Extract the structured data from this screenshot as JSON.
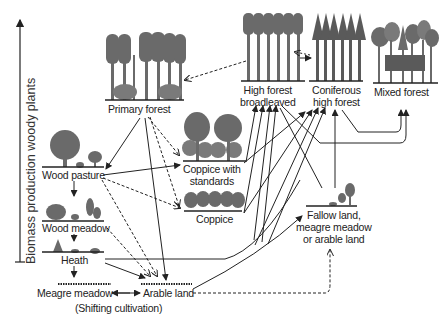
{
  "axis": {
    "label": "Biomass production woody plants"
  },
  "nodes": {
    "primary_forest": "Primary forest",
    "high_forest_broadleaved_1": "High forest",
    "high_forest_broadleaved_2": "broadleaved",
    "coniferous_1": "Coniferous",
    "coniferous_2": "high forest",
    "mixed_forest": "Mixed forest",
    "coppice_standards_1": "Coppice with",
    "coppice_standards_2": "standards",
    "coppice": "Coppice",
    "wood_pasture": "Wood pasture",
    "wood_meadow": "Wood meadow",
    "heath": "Heath",
    "meagre_meadow": "Meagre meadow",
    "arable_land": "Arable land",
    "shifting_cultivation": "(Shifting cultivation)",
    "fallow_1": "Fallow land,",
    "fallow_2": "meagre meadow",
    "fallow_3": "or arable land"
  },
  "colors": {
    "tree": "#6a6a6a",
    "tree_light": "#8a8a8a",
    "line": "#222222"
  }
}
